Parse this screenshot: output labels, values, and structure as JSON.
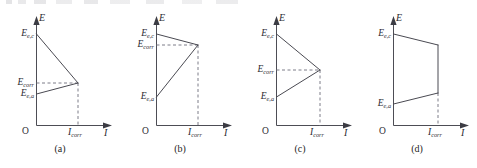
{
  "figure": {
    "panel_count": 4,
    "axes": {
      "y_axis_label": "E",
      "x_axis_label": "I",
      "origin_label": "O",
      "x_tick_label": "I",
      "x_tick_sub": "corr"
    },
    "symbols": {
      "E_cathodic_equilibrium": {
        "base": "E",
        "sub": "e,c"
      },
      "E_anodic_equilibrium": {
        "base": "E",
        "sub": "e,a"
      },
      "E_corrosion": {
        "base": "E",
        "sub": "corr"
      },
      "I_corrosion": {
        "base": "I",
        "sub": "corr"
      }
    },
    "colors": {
      "curve": "#4a4a52",
      "axis": "#4d4d55",
      "dashed_guide": "#7d7d88",
      "text": "#2b2b32",
      "background": "#ffffff"
    },
    "panels": [
      {
        "caption": "(a)",
        "labels": {
          "top_y": {
            "base": "E",
            "sub": "e,c"
          },
          "mid_y": {
            "base": "E",
            "sub": "corr"
          },
          "low_y": {
            "base": "E",
            "sub": "e,a"
          },
          "y_axis": "E",
          "x_axis": "I",
          "origin": "O",
          "x_tick": {
            "base": "I",
            "sub": "corr"
          }
        },
        "has_corr_label": true,
        "intersects": true,
        "note": "steep cathodic slope, shallow anodic slope; E_corr lies near the anodic equilibrium potential"
      },
      {
        "caption": "(b)",
        "labels": {
          "top_y": {
            "base": "E",
            "sub": "e,c"
          },
          "mid_y": {
            "base": "E",
            "sub": "corr"
          },
          "low_y": {
            "base": "E",
            "sub": "e,a"
          },
          "y_axis": "E",
          "x_axis": "I",
          "origin": "O",
          "x_tick": {
            "base": "I",
            "sub": "corr"
          }
        },
        "has_corr_label": true,
        "intersects": true,
        "note": "shallow cathodic slope, steep anodic slope; E_corr lies near the cathodic equilibrium potential"
      },
      {
        "caption": "(c)",
        "labels": {
          "top_y": {
            "base": "E",
            "sub": "e,c"
          },
          "mid_y": {
            "base": "E",
            "sub": "corr"
          },
          "low_y": {
            "base": "E",
            "sub": "e,a"
          },
          "y_axis": "E",
          "x_axis": "I",
          "origin": "O",
          "x_tick": {
            "base": "I",
            "sub": "corr"
          }
        },
        "has_corr_label": true,
        "intersects": true,
        "note": "comparable anodic and cathodic slopes; E_corr lies midway between the two equilibrium potentials"
      },
      {
        "caption": "(d)",
        "labels": {
          "top_y": {
            "base": "E",
            "sub": "e,c"
          },
          "mid_y": null,
          "low_y": {
            "base": "E",
            "sub": "e,a"
          },
          "y_axis": "E",
          "x_axis": "I",
          "origin": "O",
          "x_tick": {
            "base": "I",
            "sub": "corr"
          }
        },
        "has_corr_label": false,
        "intersects": false,
        "note": "both slopes shallow; the two curves are joined by a vertical segment at I_corr and no E_corr level is marked"
      }
    ]
  },
  "chart_data": {
    "type": "line",
    "title": "",
    "xlabel": "I",
    "ylabel": "E",
    "grid": false,
    "legend": "none",
    "subplots": [
      {
        "name": "(a)",
        "xlim": [
          0,
          1.25
        ],
        "ylim": [
          0,
          1.15
        ],
        "series": [
          {
            "name": "cathodic polarization curve",
            "x": [
              0.0,
              1.0
            ],
            "y": [
              1.0,
              0.38
            ],
            "style": "solid"
          },
          {
            "name": "anodic polarization curve",
            "x": [
              0.0,
              1.0
            ],
            "y": [
              0.24,
              0.38
            ],
            "style": "solid"
          },
          {
            "name": "E_corr guide",
            "x": [
              0.0,
              1.0
            ],
            "y": [
              0.38,
              0.38
            ],
            "style": "dashed"
          },
          {
            "name": "I_corr guide",
            "x": [
              1.0,
              1.0
            ],
            "y": [
              0.0,
              0.38
            ],
            "style": "dashed"
          }
        ],
        "ytick_values": [
          1.0,
          0.38,
          0.24
        ],
        "ytick_labels": [
          "E_e,c",
          "E_corr",
          "E_e,a"
        ],
        "xtick_values": [
          1.0
        ],
        "xtick_labels": [
          "I_corr"
        ]
      },
      {
        "name": "(b)",
        "xlim": [
          0,
          1.25
        ],
        "ylim": [
          0,
          1.15
        ],
        "series": [
          {
            "name": "cathodic polarization curve",
            "x": [
              0.0,
              1.0
            ],
            "y": [
              1.0,
              0.86
            ],
            "style": "solid"
          },
          {
            "name": "anodic polarization curve",
            "x": [
              0.0,
              1.0
            ],
            "y": [
              0.22,
              0.86
            ],
            "style": "solid"
          },
          {
            "name": "E_corr guide",
            "x": [
              0.0,
              1.0
            ],
            "y": [
              0.86,
              0.86
            ],
            "style": "dashed"
          },
          {
            "name": "I_corr guide",
            "x": [
              1.0,
              1.0
            ],
            "y": [
              0.0,
              0.86
            ],
            "style": "dashed"
          }
        ],
        "ytick_values": [
          1.0,
          0.86,
          0.22
        ],
        "ytick_labels": [
          "E_e,c",
          "E_corr",
          "E_e,a"
        ],
        "xtick_values": [
          1.0
        ],
        "xtick_labels": [
          "I_corr"
        ]
      },
      {
        "name": "(c)",
        "xlim": [
          0,
          1.25
        ],
        "ylim": [
          0,
          1.15
        ],
        "series": [
          {
            "name": "cathodic polarization curve",
            "x": [
              0.0,
              1.0
            ],
            "y": [
              1.0,
              0.56
            ],
            "style": "solid"
          },
          {
            "name": "anodic polarization curve",
            "x": [
              0.0,
              1.0
            ],
            "y": [
              0.22,
              0.56
            ],
            "style": "solid"
          },
          {
            "name": "E_corr guide",
            "x": [
              0.0,
              1.0
            ],
            "y": [
              0.56,
              0.56
            ],
            "style": "dashed"
          },
          {
            "name": "I_corr guide",
            "x": [
              1.0,
              1.0
            ],
            "y": [
              0.0,
              0.56
            ],
            "style": "dashed"
          }
        ],
        "ytick_values": [
          1.0,
          0.56,
          0.22
        ],
        "ytick_labels": [
          "E_e,c",
          "E_corr",
          "E_e,a"
        ],
        "xtick_values": [
          1.0
        ],
        "xtick_labels": [
          "I_corr"
        ]
      },
      {
        "name": "(d)",
        "xlim": [
          0,
          1.25
        ],
        "ylim": [
          0,
          1.15
        ],
        "series": [
          {
            "name": "cathodic polarization curve",
            "x": [
              0.0,
              1.0
            ],
            "y": [
              1.0,
              0.86
            ],
            "style": "solid"
          },
          {
            "name": "anodic polarization curve",
            "x": [
              0.0,
              1.0
            ],
            "y": [
              0.24,
              0.38
            ],
            "style": "solid"
          },
          {
            "name": "connecting vertical segment at I_corr",
            "x": [
              1.0,
              1.0
            ],
            "y": [
              0.38,
              0.86
            ],
            "style": "solid"
          },
          {
            "name": "I_corr guide",
            "x": [
              1.0,
              1.0
            ],
            "y": [
              0.0,
              0.38
            ],
            "style": "dashed"
          }
        ],
        "ytick_values": [
          1.0,
          0.24
        ],
        "ytick_labels": [
          "E_e,c",
          "E_e,a"
        ],
        "xtick_values": [
          1.0
        ],
        "xtick_labels": [
          "I_corr"
        ]
      }
    ]
  }
}
